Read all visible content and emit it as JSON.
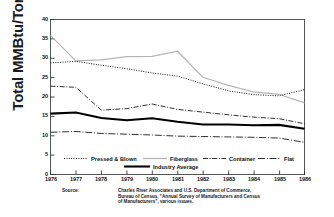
{
  "chart_data": {
    "type": "line",
    "title": "",
    "xlabel": "",
    "ylabel": "Total MMBtu/Ton",
    "x": [
      1976,
      1977,
      1978,
      1979,
      1980,
      1981,
      1982,
      1983,
      1984,
      1985,
      1986
    ],
    "xtick_labels": [
      "1976",
      "1977",
      "1978",
      "1979",
      "1980",
      "1981",
      "1982",
      "1983",
      "1984",
      "1985",
      "1986"
    ],
    "ytick_labels": [
      "0",
      "5",
      "10",
      "15",
      "20",
      "25",
      "30",
      "35",
      "40"
    ],
    "ytick_values": [
      0,
      5,
      10,
      15,
      20,
      25,
      30,
      35,
      40
    ],
    "ylim": [
      0,
      40
    ],
    "xlim": [
      1976,
      1986
    ],
    "grid": false,
    "legend_position": "inside-bottom",
    "series": [
      {
        "name": "Pressed & Blown",
        "style": "dotted",
        "color": "#1a1a1a",
        "values": [
          28.8,
          29.2,
          28.2,
          27.3,
          26.2,
          25.4,
          23.4,
          21.6,
          20.6,
          20.3,
          21.9
        ]
      },
      {
        "name": "Fiberglass",
        "style": "solid-light",
        "color": "#b4b4b4",
        "values": [
          35.9,
          29.3,
          29.6,
          30.4,
          30.5,
          31.8,
          25.1,
          23.0,
          21.3,
          20.7,
          18.5
        ]
      },
      {
        "name": "Container",
        "style": "dash-dot-short",
        "color": "#1a1a1a",
        "values": [
          22.8,
          22.5,
          16.6,
          17.0,
          18.2,
          16.8,
          16.1,
          15.4,
          14.8,
          14.4,
          13.1
        ]
      },
      {
        "name": "Flat",
        "style": "dash-dot-long",
        "color": "#1a1a1a",
        "values": [
          10.9,
          11.1,
          10.6,
          10.4,
          10.2,
          9.9,
          9.8,
          9.7,
          9.6,
          9.4,
          8.3
        ]
      },
      {
        "name": "Industry Average",
        "style": "solid-thick",
        "color": "#000000",
        "values": [
          15.7,
          16.0,
          14.6,
          14.0,
          14.5,
          13.6,
          12.9,
          12.9,
          12.7,
          12.8,
          11.8
        ]
      }
    ]
  },
  "legend": {
    "entries": [
      {
        "label": "Pressed & Blown"
      },
      {
        "label": "Fiberglass"
      },
      {
        "label": "Container"
      },
      {
        "label": "Flat"
      },
      {
        "label": "Industry Average"
      }
    ]
  },
  "source": {
    "label": "Source:",
    "line1": "Charles River Associates and U.S. Department of Commerce,",
    "line2": "Bureau of Census, \"Annual Survey of Manufacturers and Census",
    "line3": "of Manufacturers\", various issues."
  },
  "colors": {
    "frame": "#444444",
    "text": "#111111",
    "fiberglass": "#b4b4b4",
    "industry_average": "#000000"
  }
}
